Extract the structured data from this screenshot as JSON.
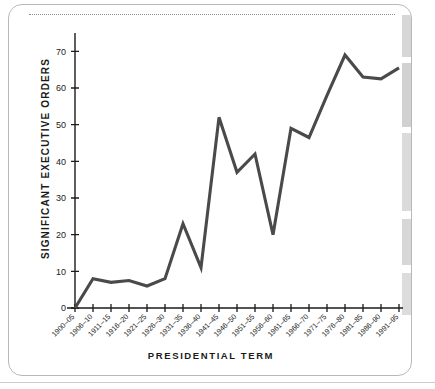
{
  "chart_data": {
    "type": "line",
    "title": "",
    "xlabel": "PRESIDENTIAL TERM",
    "ylabel": "SIGNIFICANT EXECUTIVE ORDERS",
    "categories": [
      "1900–05",
      "1906–10",
      "1911–15",
      "1916–20",
      "1921–25",
      "1926–30",
      "1931–35",
      "1936–40",
      "1941–45",
      "1946–50",
      "1951–55",
      "1956–60",
      "1961–65",
      "1966–70",
      "1971–75",
      "1976–80",
      "1981–85",
      "1986–90",
      "1991–95"
    ],
    "values": [
      0,
      8,
      7,
      7.5,
      6,
      8,
      23,
      11,
      52,
      37,
      42,
      20,
      49,
      46.5,
      58,
      69,
      63,
      62.5,
      65.5
    ],
    "ylim": [
      0,
      75
    ],
    "yticks": [
      0,
      10,
      20,
      30,
      40,
      50,
      60,
      70
    ],
    "ytick_labels": [
      "0",
      "10",
      "20",
      "30",
      "40",
      "50",
      "60",
      "70"
    ],
    "grid": false,
    "legend": null,
    "line_color": "#4a4a4a"
  },
  "axes": {
    "y_title": "SIGNIFICANT EXECUTIVE ORDERS",
    "x_title": "PRESIDENTIAL TERM"
  },
  "page": {
    "border_color": "#b8b8b8",
    "rule_color": "#8d8d8d"
  }
}
